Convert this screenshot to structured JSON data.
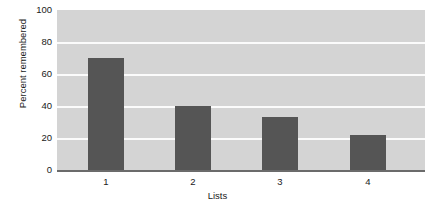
{
  "chart_data": {
    "type": "bar",
    "title": "",
    "xlabel": "Lists",
    "ylabel": "Percent remembered",
    "categories": [
      "1",
      "2",
      "3",
      "4"
    ],
    "values": [
      70,
      40,
      33,
      22
    ],
    "ylim": [
      0,
      100
    ],
    "yticks": [
      "0",
      "20",
      "40",
      "60",
      "80",
      "100"
    ],
    "ytick_values": [
      0,
      20,
      40,
      60,
      80,
      100
    ],
    "grid": true,
    "legend": false,
    "colors": {
      "bar": "#555555",
      "plot_background": "#d4d4d4",
      "gridline": "#fbfbfb",
      "axis_line": "#6b6b6b",
      "text": "#1a1a1a",
      "page_background": "#ffffff"
    }
  }
}
